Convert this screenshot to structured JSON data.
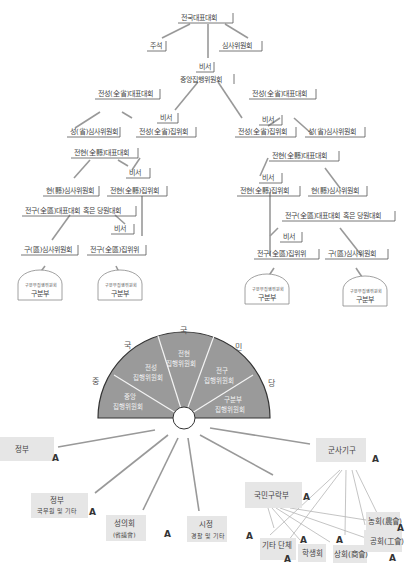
{
  "org_chart": {
    "top": {
      "national_congress": "전국대표대회",
      "chairman": "주석",
      "secretary": "비서",
      "audit_committee": "심사위원회",
      "central_executive": "중앙집행위원회"
    },
    "left_branch": {
      "province_congress": "전성(全省)대표대회",
      "province_audit": "성(省)심사위원회",
      "province_secretary": "비서",
      "province_executive": "전성(全省)집위회",
      "county_congress": "전현(全縣)대표대회",
      "county_audit": "현(縣)심사위원회",
      "county_secretary": "비서",
      "county_executive": "전현(全縣)집위회",
      "district_congress": "전구(全區)대표대회 혹은 당원대회",
      "district_audit": "구(區)심사위원회",
      "district_secretary": "비서",
      "district_executive": "전구(全區)집위위",
      "branch_left": {
        "arch": "구분부집행위원회",
        "label": "구분부"
      },
      "branch_right": {
        "arch": "구분부집행위원회",
        "label": "구분부"
      }
    },
    "right_branch": {
      "province_congress": "전성(全省)대표대회",
      "province_secretary": "비서",
      "province_executive": "전성(全省)집위회",
      "province_audit": "성(省)심사위원회",
      "county_congress": "전현(全縣)대표대회",
      "county_secretary": "비서",
      "county_executive": "전현(全縣)집위회",
      "county_audit": "현(縣)심사위원회",
      "district_congress": "전구(全區)대표대회 혹은 당원대회",
      "district_secretary": "비서",
      "district_executive": "전구(全區)집위위",
      "district_audit": "구(區)심사위원회",
      "branch_left": {
        "arch": "구분부집행위원회",
        "label": "구분부"
      },
      "branch_right": {
        "arch": "구분부집행위원회",
        "label": "구분부"
      }
    }
  },
  "fan_chart": {
    "ring_chars": [
      "중",
      "국",
      "국",
      "민",
      "당"
    ],
    "sectors": [
      {
        "line1": "중앙",
        "line2": "집행위원회"
      },
      {
        "line1": "전성",
        "line2": "집행위원회"
      },
      {
        "line1": "전현",
        "line2": "집행위원회"
      },
      {
        "line1": "전구",
        "line2": "집행위원회"
      },
      {
        "line1": "구분부",
        "line2": "집행위원회"
      }
    ],
    "sector_color": "#9a9a9a",
    "targets": [
      {
        "title": "정부",
        "sub": "",
        "mark": "A"
      },
      {
        "title": "정부",
        "sub": "국무원 및 기타",
        "mark": "A"
      },
      {
        "title": "성의회",
        "sub": "(省議會)",
        "mark": "A"
      },
      {
        "title": "시정",
        "sub": "경찰 및 기타",
        "mark": "A"
      },
      {
        "title": "국민구락부",
        "sub": "",
        "mark": "A"
      },
      {
        "title": "군사기구",
        "sub": "",
        "mark": "A"
      },
      {
        "title": "기타 단체",
        "sub": "",
        "mark": "A"
      },
      {
        "title": "학생회",
        "sub": "",
        "mark": "A"
      },
      {
        "title": "상회(商會)",
        "sub": "",
        "mark": "A"
      },
      {
        "title": "공회(工會)",
        "sub": "",
        "mark": "A"
      },
      {
        "title": "농회(農會)",
        "sub": "",
        "mark": "A"
      }
    ]
  }
}
